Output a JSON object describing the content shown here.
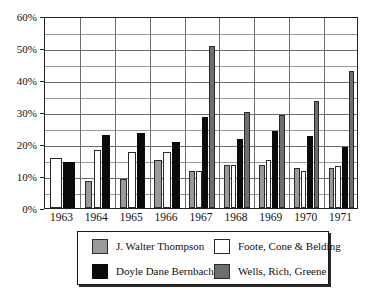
{
  "chart_data": {
    "type": "bar",
    "title": "",
    "subtitle": "",
    "xlabel": "",
    "ylabel": "",
    "categories": [
      "1963",
      "1964",
      "1965",
      "1966",
      "1967",
      "1968",
      "1969",
      "1970",
      "1971"
    ],
    "ylim": [
      0,
      60
    ],
    "y_unit": "%",
    "y_tick_labels": [
      "0%",
      "10%",
      "20%",
      "30%",
      "40%",
      "50%",
      "60%"
    ],
    "y_tick_values": [
      0,
      10,
      20,
      30,
      40,
      50,
      60
    ],
    "y_minor_gridlines": [
      5,
      15,
      25,
      35,
      45,
      55
    ],
    "grid": "horizontal-and-vertical",
    "legend_position": "bottom",
    "series": [
      {
        "name": "J. Walter Thompson",
        "key": "jwt",
        "color": "#9a9a9a",
        "values": [
          null,
          8.5,
          9.0,
          15.0,
          11.5,
          13.5,
          13.5,
          12.5,
          12.5
        ]
      },
      {
        "name": "Foote, Cone & Belding",
        "key": "fcb",
        "color": "#ffffff",
        "values": [
          15.5,
          18.0,
          17.5,
          17.5,
          11.5,
          13.5,
          15.0,
          11.5,
          13.0
        ]
      },
      {
        "name": "Doyle Dane Bernbach",
        "key": "ddb",
        "color": "#0b0b0b",
        "values": [
          14.5,
          22.8,
          23.5,
          20.5,
          28.5,
          21.5,
          24.0,
          22.5,
          19.0
        ]
      },
      {
        "name": "Wells, Rich, Greene",
        "key": "wrg",
        "color": "#6e6e6e",
        "values": [
          null,
          null,
          null,
          null,
          50.5,
          30.0,
          29.0,
          33.5,
          42.8
        ]
      }
    ]
  },
  "legend": {
    "entries": [
      {
        "label": "J. Walter Thompson",
        "key": "jwt"
      },
      {
        "label": "Foote, Cone & Belding",
        "key": "fcb"
      },
      {
        "label": "Doyle Dane Bernbach",
        "key": "ddb"
      },
      {
        "label": "Wells, Rich, Greene",
        "key": "wrg"
      }
    ]
  }
}
